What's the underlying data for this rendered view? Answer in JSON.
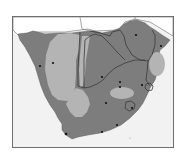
{
  "map": {
    "type": "choropleth-grayscale",
    "region": "Southern Africa",
    "colors": {
      "background": "#ffffff",
      "frame": "#6e6e6e",
      "ocean": "#f2f2f2",
      "outside_land": "#ffffff",
      "dark_zone": "#7d7d7d",
      "light_zone": "#b4b4b4",
      "border": "#3a3a3a",
      "city_dot": "#111111"
    },
    "zones": [
      {
        "name": "dark-zone",
        "shade": "dark"
      },
      {
        "name": "light-zone-namibia-interior",
        "shade": "light"
      },
      {
        "name": "light-zone-western-cape-interior",
        "shade": "light"
      },
      {
        "name": "light-zone-botswana-west",
        "shade": "light"
      },
      {
        "name": "light-zone-mozambique",
        "shade": "light"
      },
      {
        "name": "light-zone-free-state",
        "shade": "light"
      }
    ],
    "city_dots": [
      {
        "name": "city-dot-1",
        "x": 53,
        "y": 63
      },
      {
        "name": "city-dot-2",
        "x": 40,
        "y": 66
      },
      {
        "name": "city-dot-3",
        "x": 136,
        "y": 35
      },
      {
        "name": "city-dot-4",
        "x": 161,
        "y": 46
      },
      {
        "name": "city-dot-5",
        "x": 102,
        "y": 77
      },
      {
        "name": "city-dot-6",
        "x": 120,
        "y": 82
      },
      {
        "name": "city-dot-7",
        "x": 120,
        "y": 87
      },
      {
        "name": "city-dot-8",
        "x": 142,
        "y": 85
      },
      {
        "name": "city-dot-9",
        "x": 106,
        "y": 103
      },
      {
        "name": "city-dot-10",
        "x": 132,
        "y": 108
      },
      {
        "name": "city-dot-11",
        "x": 117,
        "y": 125
      },
      {
        "name": "city-dot-12",
        "x": 102,
        "y": 132
      },
      {
        "name": "city-dot-13",
        "x": 66,
        "y": 134
      }
    ]
  }
}
